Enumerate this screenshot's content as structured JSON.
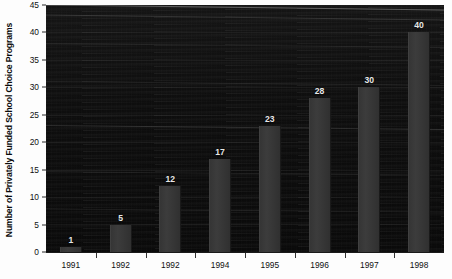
{
  "chart_data": {
    "type": "bar",
    "title": "",
    "xlabel": "",
    "ylabel": "Number of Privately Funded School Choice Programs",
    "categories": [
      "1991",
      "1992",
      "1992",
      "1994",
      "1995",
      "1996",
      "1997",
      "1998"
    ],
    "values": [
      1,
      5,
      12,
      17,
      23,
      28,
      30,
      40
    ],
    "value_labels": [
      "1",
      "5",
      "12",
      "17",
      "23",
      "28",
      "30",
      "40"
    ],
    "ylim": [
      0,
      45
    ],
    "ytick_labels": [
      "0",
      "5",
      "10",
      "15",
      "20",
      "25",
      "30",
      "35",
      "40",
      "45"
    ],
    "ytick_values": [
      0,
      5,
      10,
      15,
      20,
      25,
      30,
      35,
      40,
      45
    ],
    "grid": false,
    "legend": "none",
    "colors": {
      "plot_background": "#0f0f0f",
      "bar_fill": "#383838",
      "value_label": "#e8e8e8",
      "axis_text": "#101010",
      "page_background": "#fdfdfd"
    }
  }
}
